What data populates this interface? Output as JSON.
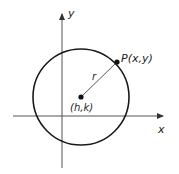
{
  "diagram": {
    "axes": {
      "x_label": "x",
      "y_label": "y"
    },
    "center": {
      "label": "(h,k)"
    },
    "point": {
      "label": "P(x,y)"
    },
    "radius": {
      "label": "r"
    },
    "colors": {
      "stroke": "#1a1a1a",
      "axis": "#555555",
      "background": "#ffffff"
    }
  }
}
